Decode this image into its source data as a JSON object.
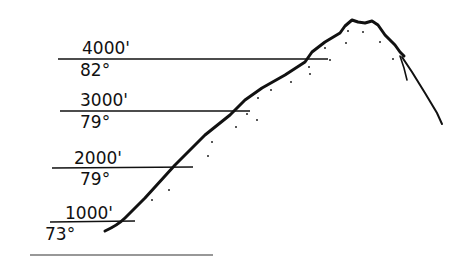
{
  "diagram": {
    "type": "mountain elevation temperature sketch",
    "levels": [
      {
        "elevation": "4000'",
        "temperature": "82°"
      },
      {
        "elevation": "3000'",
        "temperature": "79°"
      },
      {
        "elevation": "2000'",
        "temperature": "79°"
      },
      {
        "elevation": "1000'",
        "temperature": "73°"
      }
    ],
    "colors": {
      "ink": "#111111",
      "background": "#ffffff"
    }
  }
}
